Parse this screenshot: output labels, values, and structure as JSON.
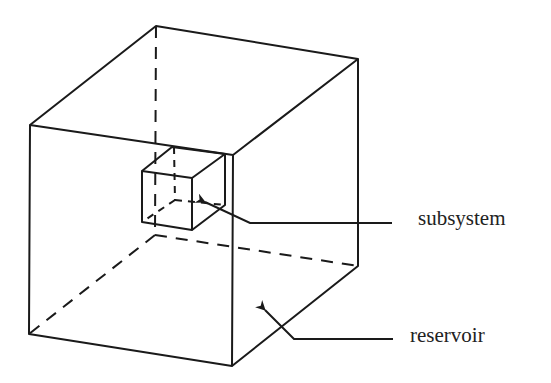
{
  "diagram": {
    "labels": {
      "subsystem": "subsystem",
      "reservoir": "reservoir"
    },
    "colors": {
      "stroke": "#1a1a1a",
      "background": "#ffffff",
      "text": "#222222"
    },
    "reservoir_cube": {
      "front_face": [
        [
          30,
          125
        ],
        [
          233,
          155
        ],
        [
          232,
          366
        ],
        [
          29,
          334
        ]
      ],
      "back_top_left": [
        156,
        26
      ],
      "back_top_right": [
        358,
        59
      ],
      "back_bottom_right": [
        358,
        266
      ],
      "back_bottom_left_hidden": [
        155,
        235
      ]
    },
    "subsystem_cube": {
      "front_face": [
        [
          142,
          171
        ],
        [
          192,
          178
        ],
        [
          192,
          230
        ],
        [
          142,
          222
        ]
      ],
      "back_top_left": [
        172,
        147
      ],
      "back_top_right": [
        225,
        154
      ],
      "back_bottom_right": [
        225,
        205
      ],
      "back_bottom_left_hidden": [
        175,
        200
      ]
    },
    "arrows": [
      {
        "name": "subsystem-pointer",
        "tip": [
          202,
          201
        ],
        "elbow": [
          250,
          223
        ],
        "end": [
          392,
          223
        ]
      },
      {
        "name": "reservoir-pointer",
        "tip": [
          262,
          307
        ],
        "elbow": [
          294,
          339
        ],
        "end": [
          393,
          339
        ]
      }
    ]
  }
}
